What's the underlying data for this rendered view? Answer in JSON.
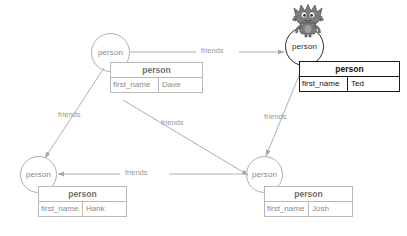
{
  "diagram": {
    "node_type_label": "person",
    "property_key": "first_name",
    "edge_label": "friends",
    "colors": {
      "line": "#b0b0b0",
      "text": "#8a8a8a",
      "selected_line": "#1a1a1a",
      "selected_text": "#111111",
      "background": "#ffffff"
    }
  },
  "nodes": [
    {
      "id": "dave",
      "circle_label": "person",
      "table_title": "person",
      "property_key": "first_name",
      "property_value": "Dave",
      "selected": false
    },
    {
      "id": "ted",
      "circle_label": "person",
      "table_title": "person",
      "property_key": "first_name",
      "property_value": "Ted",
      "selected": true
    },
    {
      "id": "hank",
      "circle_label": "person",
      "table_title": "person",
      "property_key": "first_name",
      "property_value": "Hank",
      "selected": false
    },
    {
      "id": "josh",
      "circle_label": "person",
      "table_title": "person",
      "property_key": "first_name",
      "property_value": "Josh",
      "selected": false
    }
  ],
  "edges": [
    {
      "id": "dave-ted",
      "from": "dave",
      "to": "ted",
      "label": "friends"
    },
    {
      "id": "dave-hank",
      "from": "dave",
      "to": "hank",
      "label": "friends"
    },
    {
      "id": "dave-josh",
      "from": "dave",
      "to": "josh",
      "label": "friends"
    },
    {
      "id": "ted-josh",
      "from": "ted",
      "to": "josh",
      "label": "friends"
    },
    {
      "id": "josh-hank",
      "from": "josh",
      "to": "hank",
      "label": "friends"
    }
  ],
  "mascot": {
    "name": "creature-mascot",
    "alt": "gremlin mascot"
  }
}
